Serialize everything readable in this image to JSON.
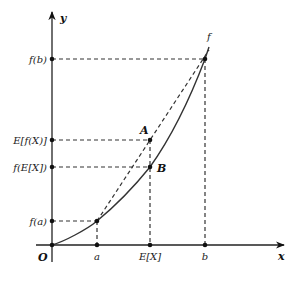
{
  "diagram": {
    "axes": {
      "x_label": "x",
      "y_label": "y",
      "origin_label": "O"
    },
    "x_ticks": [
      {
        "label": "a",
        "x": 97
      },
      {
        "label": "E[X]",
        "x": 150
      },
      {
        "label": "b",
        "x": 205
      }
    ],
    "y_ticks": [
      {
        "label": "f(b)",
        "y": 59
      },
      {
        "label": "E[f(X)]",
        "y": 140
      },
      {
        "label": "f(E[X])",
        "y": 167
      },
      {
        "label": "f(a)",
        "y": 221
      }
    ],
    "points": [
      {
        "label": "A",
        "x": 150,
        "y": 140
      },
      {
        "label": "B",
        "x": 150,
        "y": 167
      }
    ],
    "curve_label": "f"
  }
}
